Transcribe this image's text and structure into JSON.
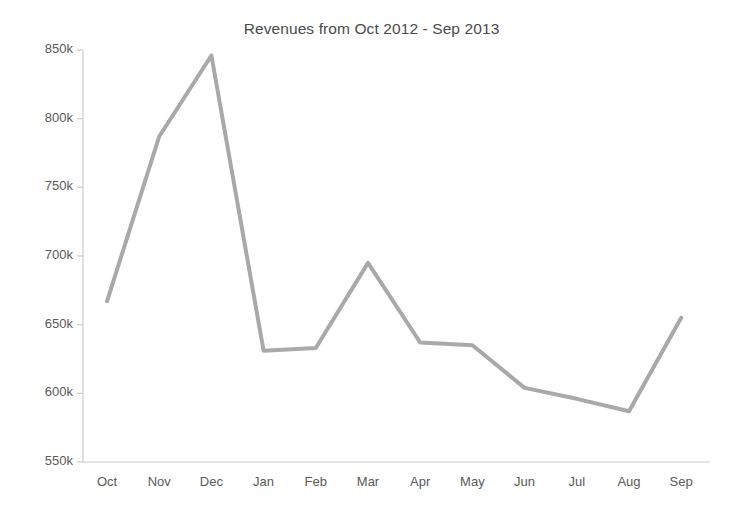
{
  "chart_data": {
    "type": "line",
    "title": "Revenues from Oct 2012 - Sep 2013",
    "xlabel": "",
    "ylabel": "",
    "categories": [
      "Oct",
      "Nov",
      "Dec",
      "Jan",
      "Feb",
      "Mar",
      "Apr",
      "May",
      "Jun",
      "Jul",
      "Aug",
      "Sep"
    ],
    "values": [
      667000,
      787000,
      846000,
      631000,
      633000,
      695000,
      637000,
      635000,
      604000,
      596000,
      587000,
      655000
    ],
    "series": [
      {
        "name": "Revenues",
        "values": [
          667000,
          787000,
          846000,
          631000,
          633000,
          695000,
          637000,
          635000,
          604000,
          596000,
          587000,
          655000
        ]
      }
    ],
    "ylim": [
      550000,
      850000
    ],
    "ytick_values": [
      550000,
      600000,
      650000,
      700000,
      750000,
      800000,
      850000
    ],
    "ytick_labels": [
      "550k",
      "600k",
      "650k",
      "700k",
      "750k",
      "800k",
      "850k"
    ],
    "xtick_labels": [
      "Oct",
      "Nov",
      "Dec",
      "Jan",
      "Feb",
      "Mar",
      "Apr",
      "May",
      "Jun",
      "Jul",
      "Aug",
      "Sep"
    ],
    "grid": false,
    "legend": false,
    "legend_position": "none",
    "line_color": "#a9a9a9",
    "axis_color": "#cccccc",
    "text_color": "#5a5a5a",
    "background_color": "#ffffff",
    "line_width": 4,
    "markers": false
  },
  "axes": {
    "plot_left": 83,
    "plot_right": 710,
    "plot_top": 50,
    "plot_bottom": 462,
    "first_point_x": 107,
    "point_spacing": 52.2
  }
}
